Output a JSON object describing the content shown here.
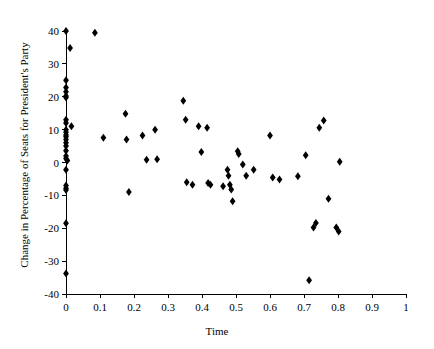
{
  "chart_data": {
    "type": "scatter",
    "title": "",
    "xlabel": "Time",
    "ylabel": "Change in Percentage of Seats for President's Party",
    "xlim": [
      0,
      1
    ],
    "ylim": [
      -40,
      40
    ],
    "xticks": [
      0,
      0.1,
      0.2,
      0.3,
      0.4,
      0.5,
      0.6,
      0.7,
      0.8,
      0.9,
      1
    ],
    "xticklabels": [
      "0",
      "0.1",
      "0.2",
      "0.3",
      "0.4",
      "0.5",
      "0.6",
      "0.7",
      "0.8",
      "0.9",
      "1"
    ],
    "yticks": [
      -40,
      -30,
      -20,
      -10,
      0,
      10,
      20,
      30,
      40
    ],
    "yticklabels": [
      "-40",
      "-30",
      "-20",
      "-10",
      "0",
      "10",
      "20",
      "30",
      "40"
    ],
    "grid": false,
    "legend": null,
    "marker": "diamond",
    "marker_color": "#000000",
    "marker_size": 4,
    "points": [
      {
        "x": 0.0,
        "y": 40.0
      },
      {
        "x": 0.012,
        "y": 34.8
      },
      {
        "x": 0.0,
        "y": 25.0
      },
      {
        "x": 0.0,
        "y": 22.8
      },
      {
        "x": 0.0,
        "y": 21.5
      },
      {
        "x": 0.0,
        "y": 20.2
      },
      {
        "x": 0.0,
        "y": 19.8
      },
      {
        "x": 0.0,
        "y": 13.0
      },
      {
        "x": 0.0,
        "y": 12.0
      },
      {
        "x": 0.016,
        "y": 11.0
      },
      {
        "x": 0.0,
        "y": 10.0
      },
      {
        "x": 0.0,
        "y": 9.2
      },
      {
        "x": 0.0,
        "y": 8.4
      },
      {
        "x": 0.0,
        "y": 7.8
      },
      {
        "x": 0.0,
        "y": 7.0
      },
      {
        "x": 0.0,
        "y": 6.0
      },
      {
        "x": 0.0,
        "y": 5.0
      },
      {
        "x": 0.0,
        "y": 3.6
      },
      {
        "x": 0.0,
        "y": 2.0
      },
      {
        "x": 0.0,
        "y": 1.2
      },
      {
        "x": 0.004,
        "y": 0.6
      },
      {
        "x": 0.0,
        "y": -2.2
      },
      {
        "x": 0.0,
        "y": -7.0
      },
      {
        "x": 0.0,
        "y": -7.8
      },
      {
        "x": 0.0,
        "y": -8.4
      },
      {
        "x": 0.0,
        "y": -18.5
      },
      {
        "x": 0.0,
        "y": -33.8
      },
      {
        "x": 0.085,
        "y": 39.5
      },
      {
        "x": 0.11,
        "y": 7.5
      },
      {
        "x": 0.175,
        "y": 14.8
      },
      {
        "x": 0.178,
        "y": 7.0
      },
      {
        "x": 0.185,
        "y": -9.0
      },
      {
        "x": 0.225,
        "y": 8.2
      },
      {
        "x": 0.237,
        "y": 0.8
      },
      {
        "x": 0.262,
        "y": 10.0
      },
      {
        "x": 0.268,
        "y": 1.0
      },
      {
        "x": 0.345,
        "y": 18.8
      },
      {
        "x": 0.352,
        "y": 13.0
      },
      {
        "x": 0.355,
        "y": -6.0
      },
      {
        "x": 0.372,
        "y": -6.8
      },
      {
        "x": 0.39,
        "y": 11.0
      },
      {
        "x": 0.398,
        "y": 3.2
      },
      {
        "x": 0.415,
        "y": 10.6
      },
      {
        "x": 0.418,
        "y": -6.2
      },
      {
        "x": 0.425,
        "y": -6.8
      },
      {
        "x": 0.462,
        "y": -7.2
      },
      {
        "x": 0.475,
        "y": -2.2
      },
      {
        "x": 0.478,
        "y": -4.0
      },
      {
        "x": 0.482,
        "y": -6.8
      },
      {
        "x": 0.486,
        "y": -8.2
      },
      {
        "x": 0.49,
        "y": -11.8
      },
      {
        "x": 0.505,
        "y": 3.4
      },
      {
        "x": 0.508,
        "y": 2.6
      },
      {
        "x": 0.52,
        "y": -0.6
      },
      {
        "x": 0.53,
        "y": -4.0
      },
      {
        "x": 0.552,
        "y": -2.2
      },
      {
        "x": 0.6,
        "y": 8.2
      },
      {
        "x": 0.608,
        "y": -4.6
      },
      {
        "x": 0.628,
        "y": -5.2
      },
      {
        "x": 0.682,
        "y": -4.2
      },
      {
        "x": 0.705,
        "y": 2.2
      },
      {
        "x": 0.715,
        "y": -35.8
      },
      {
        "x": 0.728,
        "y": -19.8
      },
      {
        "x": 0.735,
        "y": -18.4
      },
      {
        "x": 0.745,
        "y": 10.6
      },
      {
        "x": 0.758,
        "y": 12.8
      },
      {
        "x": 0.772,
        "y": -11.0
      },
      {
        "x": 0.795,
        "y": -19.8
      },
      {
        "x": 0.802,
        "y": -21.0
      },
      {
        "x": 0.805,
        "y": 0.2
      }
    ]
  },
  "figure": {
    "background_color": "#ffffff",
    "axis_color": "#000000",
    "marker_color": "#000000"
  }
}
